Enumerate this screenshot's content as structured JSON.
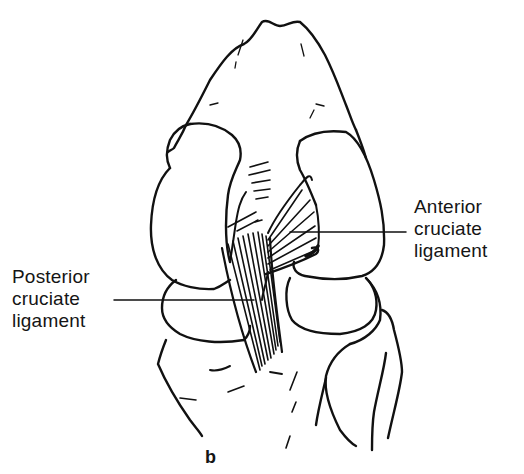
{
  "figure": {
    "panel_letter": "b",
    "stroke_color": "#111111",
    "background": "#ffffff"
  },
  "labels": {
    "anterior": {
      "lines": [
        "Anterior",
        "cruciate",
        "ligament"
      ]
    },
    "posterior": {
      "lines": [
        "Posterior",
        "cruciate",
        "ligament"
      ]
    }
  }
}
